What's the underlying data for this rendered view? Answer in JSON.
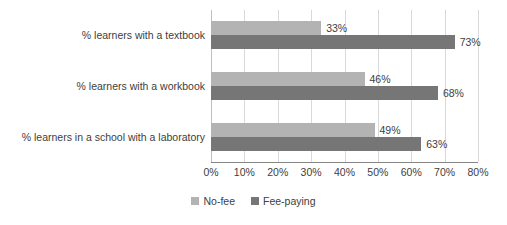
{
  "chart_data": {
    "type": "bar",
    "orientation": "horizontal",
    "title": "",
    "xlabel": "",
    "ylabel": "",
    "xlim": [
      0,
      80
    ],
    "xtick_labels": [
      "0%",
      "10%",
      "20%",
      "30%",
      "40%",
      "50%",
      "60%",
      "70%",
      "80%"
    ],
    "xtick_values": [
      0,
      10,
      20,
      30,
      40,
      50,
      60,
      70,
      80
    ],
    "grid": true,
    "legend_position": "bottom",
    "categories": [
      "% learners with a textbook",
      "% learners with a workbook",
      "% learners in a school with a laboratory"
    ],
    "series": [
      {
        "name": "No-fee",
        "color": "#b3b3b3",
        "values": [
          33,
          46,
          49
        ],
        "data_labels": [
          "33%",
          "46%",
          "49%"
        ]
      },
      {
        "name": "Fee-paying",
        "color": "#767676",
        "values": [
          73,
          68,
          63
        ],
        "data_labels": [
          "73%",
          "68%",
          "63%"
        ]
      }
    ]
  },
  "legend": {
    "items": [
      {
        "label": "No-fee",
        "color": "#b3b3b3"
      },
      {
        "label": "Fee-paying",
        "color": "#767676"
      }
    ]
  }
}
